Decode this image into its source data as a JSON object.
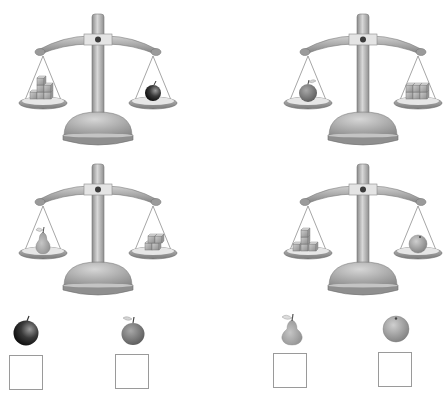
{
  "worksheet": {
    "header_fragment": "",
    "colors": {
      "metal": "#a8a8a8",
      "metal_dark": "#6e6e6e",
      "metal_light": "#dcdcdc",
      "box_border": "#9a9a9a",
      "apple_black": "#1e1e1e",
      "apple_red": "#7a7a7a",
      "pear": "#a5a5a5",
      "orange": "#9c9c9c"
    },
    "scales": [
      {
        "id": "scale-1",
        "left_pan": {
          "item": "cubes",
          "count": 6
        },
        "right_pan": {
          "item": "black-apple"
        }
      },
      {
        "id": "scale-2",
        "left_pan": {
          "item": "red-apple"
        },
        "right_pan": {
          "item": "cubes",
          "count": 6
        }
      },
      {
        "id": "scale-3",
        "left_pan": {
          "item": "pear"
        },
        "right_pan": {
          "item": "cubes",
          "count": 4
        }
      },
      {
        "id": "scale-4",
        "left_pan": {
          "item": "cubes",
          "count": 5
        },
        "right_pan": {
          "item": "orange"
        }
      }
    ],
    "answers": [
      {
        "fruit": "black-apple",
        "value": ""
      },
      {
        "fruit": "red-apple",
        "value": ""
      },
      {
        "fruit": "pear",
        "value": ""
      },
      {
        "fruit": "orange",
        "value": ""
      }
    ]
  }
}
